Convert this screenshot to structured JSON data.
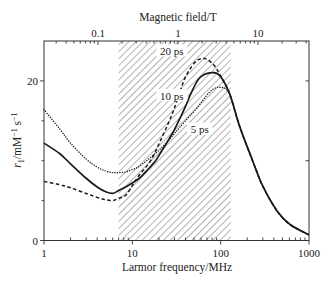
{
  "figure": {
    "top_axis_title": "Magnetic field/T",
    "bottom_axis_title": "Larmor frequency/MHz",
    "y_axis_title": {
      "symbol": "r",
      "subscript": "1",
      "unit": "/mM",
      "exp1": "−1",
      "space_s": " s",
      "exp2": "−1"
    },
    "colors": {
      "line": "#1a1a1a",
      "axis": "#333333",
      "hatch": "#555555",
      "background": "#ffffff"
    }
  },
  "chart_data": {
    "type": "line",
    "title": "",
    "xlabel": "Larmor frequency/MHz",
    "x_scale": "log",
    "xlim": [
      1,
      1000
    ],
    "x_ticks": [
      1,
      10,
      100,
      1000
    ],
    "x_tick_labels": [
      "1",
      "10",
      "100",
      "1000"
    ],
    "secondary_xlabel": "Magnetic field/T",
    "secondary_x_ticks": [
      0.1,
      1,
      10
    ],
    "secondary_x_tick_labels": [
      "0.1",
      "1",
      "10"
    ],
    "ylabel": "r1/mM⁻¹ s⁻¹",
    "ylim": [
      0,
      25
    ],
    "y_ticks": [
      0,
      20
    ],
    "y_tick_labels": [
      "0",
      "20"
    ],
    "y_minor_ticks": [
      5,
      10,
      15
    ],
    "right_y_ticks": [
      10,
      20
    ],
    "grid": false,
    "legend": "none (curves labelled inline)",
    "shaded_region": {
      "x_range": [
        7,
        130
      ],
      "pattern": "diagonal hatch"
    },
    "series": [
      {
        "name": "20 ps",
        "style": "dashed",
        "points": [
          [
            1,
            7.4
          ],
          [
            1.5,
            7.0
          ],
          [
            2,
            6.6
          ],
          [
            3,
            5.9
          ],
          [
            4,
            5.4
          ],
          [
            5,
            5.1
          ],
          [
            6,
            5.0
          ],
          [
            7,
            5.3
          ],
          [
            8.5,
            5.7
          ],
          [
            10,
            6.9
          ],
          [
            12,
            8.2
          ],
          [
            16.3,
            10.1
          ],
          [
            22,
            13.1
          ],
          [
            28.6,
            16.0
          ],
          [
            35,
            18.8
          ],
          [
            40,
            20.5
          ],
          [
            50,
            22.2
          ],
          [
            60,
            22.8
          ],
          [
            70,
            22.7
          ],
          [
            85,
            21.9
          ],
          [
            100,
            20.6
          ],
          [
            126,
            18.4
          ],
          [
            164,
            14.3
          ],
          [
            230,
            10.0
          ],
          [
            300,
            6.8
          ],
          [
            435,
            3.7
          ],
          [
            610,
            2.0
          ],
          [
            1000,
            0.7
          ]
        ]
      },
      {
        "name": "10 ps",
        "style": "solid",
        "points": [
          [
            1,
            12.2
          ],
          [
            1.5,
            10.9
          ],
          [
            2,
            9.6
          ],
          [
            3,
            7.8
          ],
          [
            4,
            6.7
          ],
          [
            5,
            6.1
          ],
          [
            6,
            5.9
          ],
          [
            7.1,
            6.3
          ],
          [
            9,
            6.9
          ],
          [
            12,
            7.8
          ],
          [
            15,
            8.9
          ],
          [
            18.6,
            10.1
          ],
          [
            22,
            11.4
          ],
          [
            26,
            12.7
          ],
          [
            30,
            13.9
          ],
          [
            35.6,
            15.6
          ],
          [
            40,
            16.8
          ],
          [
            46,
            18.4
          ],
          [
            57,
            20.3
          ],
          [
            75,
            21.0
          ],
          [
            97,
            20.7
          ],
          [
            126,
            18.4
          ],
          [
            164,
            14.3
          ],
          [
            230,
            10.0
          ],
          [
            300,
            6.8
          ],
          [
            435,
            3.7
          ],
          [
            610,
            2.0
          ],
          [
            1000,
            0.7
          ]
        ]
      },
      {
        "name": "5 ps",
        "style": "dotted",
        "points": [
          [
            1,
            16.4
          ],
          [
            1.5,
            14.0
          ],
          [
            2,
            12.2
          ],
          [
            3,
            10.2
          ],
          [
            4,
            9.2
          ],
          [
            5,
            8.7
          ],
          [
            6,
            8.5
          ],
          [
            7.1,
            8.5
          ],
          [
            8.5,
            8.6
          ],
          [
            10,
            8.9
          ],
          [
            12,
            9.3
          ],
          [
            18.6,
            11.0
          ],
          [
            25,
            12.4
          ],
          [
            31,
            13.6
          ],
          [
            40,
            15.0
          ],
          [
            53,
            16.5
          ],
          [
            75,
            18.6
          ],
          [
            97,
            19.2
          ],
          [
            126,
            18.4
          ],
          [
            164,
            14.3
          ],
          [
            230,
            10.0
          ],
          [
            300,
            6.8
          ],
          [
            435,
            3.7
          ],
          [
            610,
            2.0
          ],
          [
            1000,
            0.7
          ]
        ]
      }
    ],
    "annotations": [
      {
        "text": "20 ps",
        "x": 28,
        "y": 23.7,
        "series": "20 ps"
      },
      {
        "text": "10 ps",
        "x": 28,
        "y": 18.1,
        "series": "10 ps"
      },
      {
        "text": "5 ps",
        "x": 58,
        "y": 13.9,
        "series": "5 ps"
      }
    ]
  }
}
